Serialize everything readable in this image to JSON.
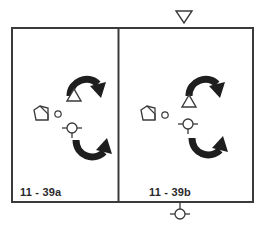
{
  "diagram": {
    "type": "camera-blocking-floor-plan",
    "colors": {
      "stroke": "#3a3a3a",
      "arrow_fill": "#1e1e1e",
      "background": "#ffffff"
    },
    "panels": [
      {
        "id": "a",
        "label": "11 - 39a",
        "symbols": [
          "curved-arrow-clockwise",
          "triangle-up",
          "camera-pentagon",
          "small-circle",
          "crosshair-circle",
          "curved-arrow-counterclockwise"
        ]
      },
      {
        "id": "b",
        "label": "11 - 39b",
        "symbols": [
          "curved-arrow-clockwise",
          "triangle-up",
          "camera-pentagon",
          "small-circle",
          "crosshair-circle",
          "curved-arrow-counterclockwise"
        ]
      }
    ],
    "outside_symbols": {
      "top": "triangle-down",
      "bottom": "crosshair-circle"
    }
  }
}
